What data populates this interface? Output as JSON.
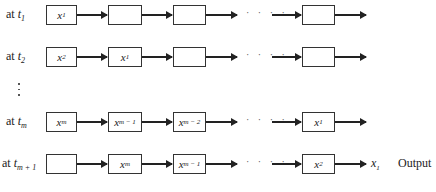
{
  "diagram": {
    "type": "shift-register-timeline",
    "rows": [
      {
        "time_prefix": "at",
        "time_var": "t",
        "time_sub": "1",
        "y": 15,
        "cells": [
          {
            "var": "x",
            "sub": "1"
          },
          {
            "var": "",
            "sub": ""
          },
          {
            "var": "",
            "sub": ""
          },
          {
            "var": "",
            "sub": ""
          }
        ],
        "output": null
      },
      {
        "time_prefix": "at",
        "time_var": "t",
        "time_sub": "2",
        "y": 57,
        "cells": [
          {
            "var": "x",
            "sub": "2"
          },
          {
            "var": "x",
            "sub": "1"
          },
          {
            "var": "",
            "sub": ""
          },
          {
            "var": "",
            "sub": ""
          }
        ],
        "output": null
      },
      {
        "time_prefix": "at",
        "time_var": "t",
        "time_sub": "m",
        "y": 122,
        "cells": [
          {
            "var": "x",
            "sub": "m"
          },
          {
            "var": "x",
            "sub": "m − 1"
          },
          {
            "var": "x",
            "sub": "m − 2"
          },
          {
            "var": "x",
            "sub": "1"
          }
        ],
        "output": null
      },
      {
        "time_prefix": "at",
        "time_var": "t",
        "time_sub": "m + 1",
        "y": 164,
        "cells": [
          {
            "var": "",
            "sub": ""
          },
          {
            "var": "x",
            "sub": "m"
          },
          {
            "var": "x",
            "sub": "m − 1"
          },
          {
            "var": "x",
            "sub": "2"
          }
        ],
        "output": {
          "var": "x",
          "sub": "1",
          "label": "Output"
        }
      }
    ],
    "ellipsis_horizontal": "· · · ·",
    "ellipsis_vertical": "⋮"
  }
}
